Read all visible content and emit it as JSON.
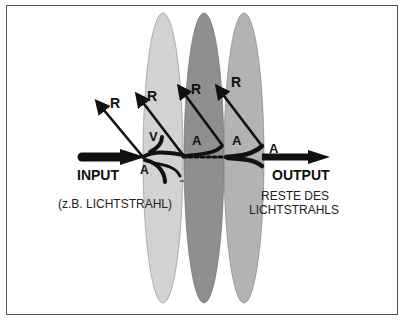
{
  "diagram": {
    "input_label": "INPUT",
    "input_note": "(z.B. LICHTSTRAHL)",
    "output_label": "OUTPUT",
    "output_note_line1": "RESTE DES",
    "output_note_line2": "LICHTSTRAHLS",
    "reflection_labels": [
      "R",
      "R",
      "R",
      "R"
    ],
    "absorption_labels": [
      "A",
      "A",
      "A",
      "A"
    ],
    "scatter_label": "V",
    "layers": [
      {
        "name": "layer-1",
        "color": "#d2d2d2"
      },
      {
        "name": "layer-2",
        "color": "#8f8f8f"
      },
      {
        "name": "layer-3",
        "color": "#b3b3b3"
      }
    ]
  }
}
